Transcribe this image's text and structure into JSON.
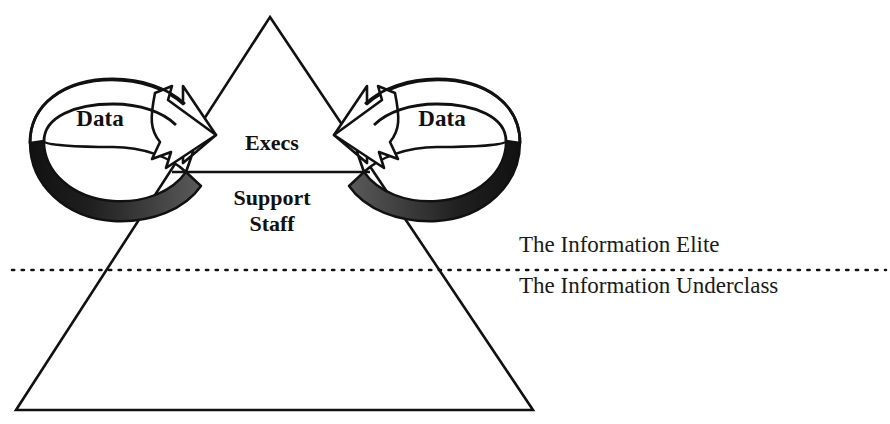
{
  "diagram": {
    "pyramid": {
      "top_tier_label": "Execs",
      "second_tier_label_line1": "Support",
      "second_tier_label_line2": "Staff"
    },
    "arrows": {
      "left_label": "Data",
      "right_label": "Data"
    },
    "divider": {
      "above_label": "The Information Elite",
      "below_label": "The Information Underclass"
    },
    "colors": {
      "stroke": "#111111",
      "fill": "#ffffff",
      "ribbon_shadow_dark": "#1c1c1c",
      "ribbon_shadow_mid": "#4a4a4a",
      "background": "#ffffff"
    }
  }
}
